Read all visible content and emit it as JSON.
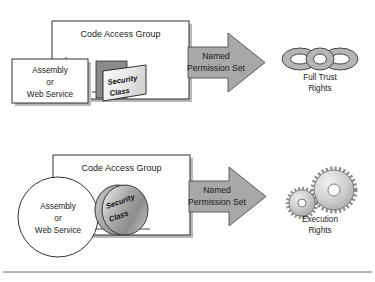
{
  "figure": {
    "background_color": "#ffffff",
    "arrow_color": "#a8a8a8",
    "shadow_color": "#b9b9b9",
    "security_class_backing_color": "#8a8a8a",
    "outline_color": "#1c1c1c",
    "divider_rule_color": "#6f6f6f"
  },
  "rows": [
    {
      "id": "full-trust-row",
      "source": {
        "shape": "rectangle",
        "line1": "Assembly",
        "line2": "or",
        "line3": "Web Service"
      },
      "group": {
        "label": "Code Access Group"
      },
      "security_class": {
        "shape": "parallelogram",
        "line1": "Security",
        "line2": "Class"
      },
      "arrow": {
        "line1": "Named",
        "line2": "Permission Set"
      },
      "result": {
        "icon": "chain-links-icon",
        "line1": "Full Trust",
        "line2": "Rights"
      }
    },
    {
      "id": "execution-rights-row",
      "source": {
        "shape": "ellipse",
        "line1": "Assembly",
        "line2": "or",
        "line3": "Web Service"
      },
      "group": {
        "label": "Code Access Group"
      },
      "security_class": {
        "shape": "sphere",
        "line1": "Security",
        "line2": "Class"
      },
      "arrow": {
        "line1": "Named",
        "line2": "Permission Set"
      },
      "result": {
        "icon": "gears-icon",
        "line1": "Execution",
        "line2": "Rights"
      }
    }
  ]
}
